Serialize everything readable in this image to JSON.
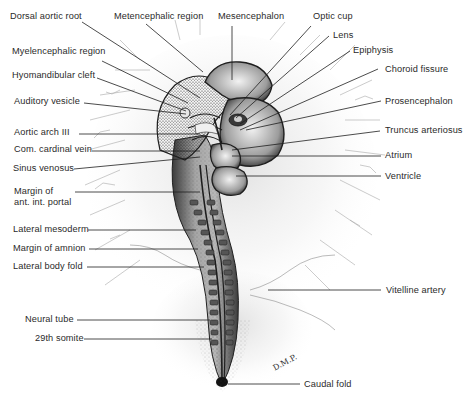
{
  "figure": {
    "signature": "D.M.P."
  },
  "labels": {
    "left": [
      {
        "id": "dorsal_aortic_root",
        "text": "Dorsal aortic root"
      },
      {
        "id": "myelencephalic_region",
        "text": "Myelencephalic region"
      },
      {
        "id": "hyomandibular_cleft",
        "text": "Hyomandibular cleft"
      },
      {
        "id": "auditory_vesicle",
        "text": "Auditory vesicle"
      },
      {
        "id": "aortic_arch_iii",
        "text": "Aortic arch III"
      },
      {
        "id": "com_cardinal_vein",
        "text": "Com. cardinal vein"
      },
      {
        "id": "sinus_venosus",
        "text": "Sinus venosus"
      },
      {
        "id": "margin_ant_int_portal",
        "text": "Margin of\nant. int. portal"
      },
      {
        "id": "lateral_mesoderm",
        "text": "Lateral mesoderm"
      },
      {
        "id": "margin_of_amnion",
        "text": "Margin of amnion"
      },
      {
        "id": "lateral_body_fold",
        "text": "Lateral body fold"
      },
      {
        "id": "neural_tube",
        "text": "Neural tube"
      },
      {
        "id": "somite_29",
        "text": "29th somite"
      }
    ],
    "top": [
      {
        "id": "metencephalic_region",
        "text": "Metencephalic region"
      },
      {
        "id": "mesencephalon",
        "text": "Mesencephalon"
      }
    ],
    "right": [
      {
        "id": "optic_cup",
        "text": "Optic cup"
      },
      {
        "id": "lens",
        "text": "Lens"
      },
      {
        "id": "epiphysis",
        "text": "Epiphysis"
      },
      {
        "id": "choroid_fissure",
        "text": "Choroid fissure"
      },
      {
        "id": "prosencephalon",
        "text": "Prosencephalon"
      },
      {
        "id": "truncus_arteriosus",
        "text": "Truncus arteriosus"
      },
      {
        "id": "atrium",
        "text": "Atrium"
      },
      {
        "id": "ventricle",
        "text": "Ventricle"
      },
      {
        "id": "vitelline_artery",
        "text": "Vitelline artery"
      },
      {
        "id": "caudal_fold",
        "text": "Caudal fold"
      }
    ]
  },
  "colors": {
    "ink": "#1e1e1e",
    "label": "#2a2a2a",
    "stipple": "#9a9a9a",
    "background": "#ffffff"
  }
}
